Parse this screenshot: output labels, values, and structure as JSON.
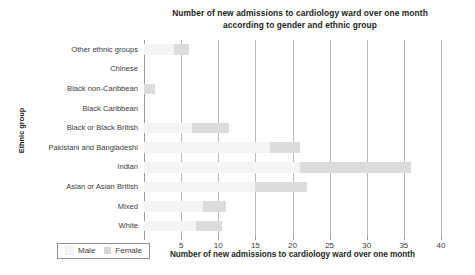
{
  "chart_data": {
    "type": "bar",
    "orientation": "horizontal",
    "stacked": true,
    "title": "Number of new admissions to cardiology ward over one month according to gender and ethnic group",
    "title_line1": "Number of new admissions to cardiology ward over one month",
    "title_line2": "according to gender and ethnic group",
    "xlabel": "Number of new admissions to cardiology ward over one month",
    "ylabel": "Ethnic group",
    "xlim": [
      0,
      40
    ],
    "xticks": [
      0,
      5,
      10,
      15,
      20,
      25,
      30,
      35,
      40
    ],
    "xtick_labels": [
      "0",
      "5",
      "10",
      "15",
      "20",
      "25",
      "30",
      "35",
      "40"
    ],
    "grid": "vertical",
    "legend_position": "bottom-left",
    "categories": [
      "Other ethnic groups",
      "Chinese",
      "Black non-Caribbean",
      "Black Caribbean",
      "Black or Black British",
      "Pakistani and Bangladeshi",
      "Indian",
      "Asian or Asian British",
      "Mixed",
      "White"
    ],
    "series": [
      {
        "name": "Male",
        "color": "#f4f4f4",
        "values": [
          4,
          0,
          0,
          0,
          6.5,
          17,
          21,
          15,
          8,
          7
        ]
      },
      {
        "name": "Female",
        "color": "#dcdcdc",
        "values": [
          2,
          0,
          1.5,
          0,
          5,
          4,
          15,
          7,
          3,
          3.5
        ]
      }
    ],
    "totals": [
      6,
      0,
      1.5,
      0,
      11.5,
      21,
      36,
      22,
      11,
      10.5
    ]
  },
  "legend": {
    "items": [
      {
        "label": "Male"
      },
      {
        "label": "Female"
      }
    ]
  }
}
